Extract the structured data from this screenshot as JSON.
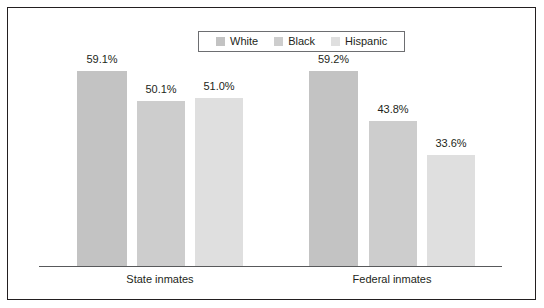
{
  "chart_data": {
    "type": "bar",
    "title": "",
    "subtitle": "",
    "xlabel": "",
    "ylabel": "",
    "categories": [
      "State inmates",
      "Federal inmates"
    ],
    "series": [
      {
        "name": "White",
        "color": "#c3c3c3",
        "values": [
          59.1,
          59.2
        ],
        "labels": [
          "59.1%",
          "59.2%"
        ]
      },
      {
        "name": "Black",
        "color": "#cdcdcd",
        "values": [
          50.1,
          43.8
        ],
        "labels": [
          "50.1%",
          "43.8%"
        ]
      },
      {
        "name": "Hispanic",
        "color": "#dfdfdf",
        "values": [
          51.0,
          33.6
        ],
        "labels": [
          "51.0%",
          "33.6%"
        ]
      }
    ],
    "ylim": [
      0,
      63
    ],
    "grid": false,
    "legend_position": "top-center",
    "legend_entries": [
      "White",
      "Black",
      "Hispanic"
    ],
    "axis_color": "#58595b",
    "frame_color": "#231f20",
    "background_color": "#ffffff"
  },
  "legend": {
    "items": [
      {
        "label": "White"
      },
      {
        "label": "Black"
      },
      {
        "label": "Hispanic"
      }
    ]
  },
  "bars": [
    {
      "value_label": "59.1%",
      "group": "State inmates",
      "series": "White"
    },
    {
      "value_label": "50.1%",
      "group": "State inmates",
      "series": "Black"
    },
    {
      "value_label": "51.0%",
      "group": "State inmates",
      "series": "Hispanic"
    },
    {
      "value_label": "59.2%",
      "group": "Federal inmates",
      "series": "White"
    },
    {
      "value_label": "43.8%",
      "group": "Federal inmates",
      "series": "Black"
    },
    {
      "value_label": "33.6%",
      "group": "Federal inmates",
      "series": "Hispanic"
    }
  ],
  "groups": [
    {
      "label": "State inmates"
    },
    {
      "label": "Federal inmates"
    }
  ]
}
